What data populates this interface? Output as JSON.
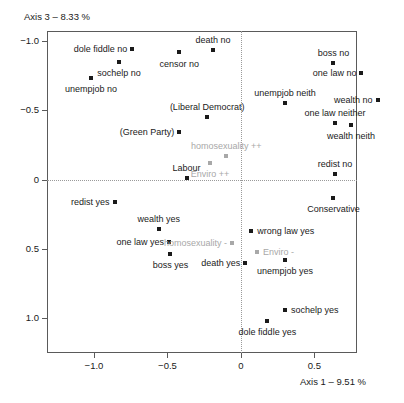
{
  "chart_data": {
    "type": "scatter",
    "title": "",
    "xlabel": "Axis 1 – 9.51 %",
    "ylabel": "Axis 3 – 8.33 %",
    "xlim": [
      -1.32,
      0.79
    ],
    "ylim": [
      -1.07,
      1.25
    ],
    "y_axis_inverted": true,
    "grid": "dotted reference lines at x=0 and y=0",
    "legend": null,
    "xticks": [
      -1.0,
      -0.5,
      0,
      0.5
    ],
    "xtick_labels": [
      "−1.0",
      "−0.5",
      "0",
      "0.5"
    ],
    "yticks": [
      -1.0,
      -0.5,
      0,
      0.5,
      1.0
    ],
    "ytick_labels": [
      "−1.0",
      "−0.5",
      "0",
      "0.5",
      "1.0"
    ],
    "point_color": "#1a1a1a",
    "supplementary_color": "#a8a8a8",
    "points": [
      {
        "label": "dole fiddle no",
        "x": -0.74,
        "y": -0.94,
        "color": "#1a1a1a",
        "anchor": "rl",
        "lx": -5,
        "ly": 0
      },
      {
        "label": "censor no",
        "x": -0.42,
        "y": -0.92,
        "color": "#1a1a1a",
        "anchor": "ct",
        "lx": 0,
        "ly": 7
      },
      {
        "label": "death no",
        "x": -0.19,
        "y": -0.93,
        "color": "#1a1a1a",
        "anchor": "ct",
        "lx": 0,
        "ly": -15
      },
      {
        "label": "sochelp no",
        "x": -0.83,
        "y": -0.85,
        "color": "#1a1a1a",
        "anchor": "ct",
        "lx": 0,
        "ly": 6
      },
      {
        "label": "unempjob no",
        "x": -1.02,
        "y": -0.73,
        "color": "#1a1a1a",
        "anchor": "ct",
        "lx": 0,
        "ly": 6
      },
      {
        "label": "boss no",
        "x": 0.63,
        "y": -0.84,
        "color": "#1a1a1a",
        "anchor": "ct",
        "lx": 0,
        "ly": -15
      },
      {
        "label": "one law no",
        "x": 0.82,
        "y": -0.77,
        "color": "#1a1a1a",
        "anchor": "rl",
        "lx": -5,
        "ly": 0
      },
      {
        "label": "unempjob neith",
        "x": 0.3,
        "y": -0.55,
        "color": "#1a1a1a",
        "anchor": "ct",
        "lx": 0,
        "ly": -15
      },
      {
        "label": "wealth no",
        "x": 0.93,
        "y": -0.57,
        "color": "#1a1a1a",
        "anchor": "rl",
        "lx": -5,
        "ly": 0
      },
      {
        "label": "one law neither",
        "x": 0.64,
        "y": -0.41,
        "color": "#1a1a1a",
        "anchor": "ct",
        "lx": 0,
        "ly": -15
      },
      {
        "label": "wealth neith",
        "x": 0.75,
        "y": -0.39,
        "color": "#1a1a1a",
        "anchor": "ct",
        "lx": 0,
        "ly": 6
      },
      {
        "label": "(Liberal Democrat)",
        "x": -0.23,
        "y": -0.45,
        "color": "#1a1a1a",
        "anchor": "ct",
        "lx": 0,
        "ly": -15
      },
      {
        "label": "(Green Party)",
        "x": -0.42,
        "y": -0.34,
        "color": "#1a1a1a",
        "anchor": "rl",
        "lx": -5,
        "ly": 0
      },
      {
        "label": "homosexuality ++",
        "x": -0.1,
        "y": -0.17,
        "color": "#a8a8a8",
        "anchor": "ct",
        "lx": 0,
        "ly": -15
      },
      {
        "label": "Enviro ++",
        "x": -0.21,
        "y": -0.12,
        "color": "#a8a8a8",
        "anchor": "ct",
        "lx": 0,
        "ly": 6
      },
      {
        "label": "Labour",
        "x": -0.37,
        "y": -0.01,
        "color": "#1a1a1a",
        "anchor": "ct",
        "lx": 0,
        "ly": -15
      },
      {
        "label": "redist no",
        "x": 0.64,
        "y": -0.04,
        "color": "#1a1a1a",
        "anchor": "ct",
        "lx": 0,
        "ly": -15
      },
      {
        "label": "redist yes",
        "x": -0.86,
        "y": 0.16,
        "color": "#1a1a1a",
        "anchor": "rl",
        "lx": -5,
        "ly": 0
      },
      {
        "label": "Conservative",
        "x": 0.63,
        "y": 0.13,
        "color": "#1a1a1a",
        "anchor": "ct",
        "lx": 0,
        "ly": 6
      },
      {
        "label": "wealth yes",
        "x": -0.56,
        "y": 0.36,
        "color": "#1a1a1a",
        "anchor": "ct",
        "lx": 0,
        "ly": -15
      },
      {
        "label": "one law yes",
        "x": -0.49,
        "y": 0.45,
        "color": "#1a1a1a",
        "anchor": "rl",
        "lx": -5,
        "ly": 0
      },
      {
        "label": "wrong law yes",
        "x": 0.07,
        "y": 0.37,
        "color": "#1a1a1a",
        "anchor": "lr",
        "lx": 6,
        "ly": 0
      },
      {
        "label": "homosexuality -",
        "x": -0.06,
        "y": 0.46,
        "color": "#a8a8a8",
        "anchor": "rl",
        "lx": -5,
        "ly": 0
      },
      {
        "label": "boss yes",
        "x": -0.48,
        "y": 0.54,
        "color": "#1a1a1a",
        "anchor": "ct",
        "lx": 0,
        "ly": 6
      },
      {
        "label": "Enviro -",
        "x": 0.11,
        "y": 0.52,
        "color": "#a8a8a8",
        "anchor": "lr",
        "lx": 6,
        "ly": 0
      },
      {
        "label": "death yes",
        "x": 0.03,
        "y": 0.6,
        "color": "#1a1a1a",
        "anchor": "rl",
        "lx": -5,
        "ly": 0
      },
      {
        "label": "unempjob yes",
        "x": 0.3,
        "y": 0.58,
        "color": "#1a1a1a",
        "anchor": "ct",
        "lx": 0,
        "ly": 6
      },
      {
        "label": "sochelp yes",
        "x": 0.3,
        "y": 0.94,
        "color": "#1a1a1a",
        "anchor": "lr",
        "lx": 6,
        "ly": 0
      },
      {
        "label": "dole fiddle yes",
        "x": 0.18,
        "y": 1.02,
        "color": "#1a1a1a",
        "anchor": "ct",
        "lx": 0,
        "ly": 6
      }
    ]
  }
}
